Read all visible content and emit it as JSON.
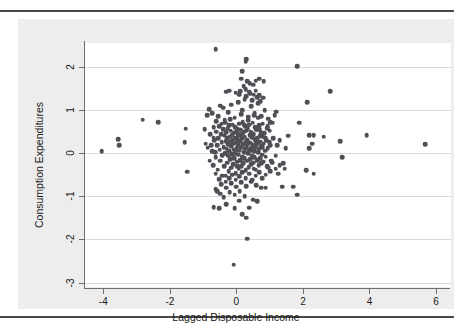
{
  "chart_data": {
    "type": "scatter",
    "title": "",
    "xlabel": "Lagged Disposable Income",
    "ylabel": "Consumption Expenditures",
    "xlim": [
      -4.55,
      6.45
    ],
    "ylim": [
      -3.1,
      2.55
    ],
    "xticks": [
      -4,
      -2,
      0,
      2,
      4,
      6
    ],
    "xtick_labels": [
      "-4",
      "-2",
      "0",
      "2",
      "4",
      "6"
    ],
    "yticks": [
      2,
      1,
      0,
      -1,
      -2,
      -3
    ],
    "ytick_labels": [
      "2",
      "1",
      "0",
      "-1",
      "-2",
      "-3"
    ],
    "grid": "horizontal",
    "legend": "none",
    "marker_color": "#4f5055",
    "marker_size": 4.6,
    "plot_background": "#ffffff",
    "graph_background": "#ededed",
    "gridline_color": "#d9d9d9",
    "axis_color": "#6e6e6e",
    "n_points": 352,
    "points": [
      [
        -4.05,
        0.05
      ],
      [
        -3.55,
        0.32
      ],
      [
        -3.52,
        0.18
      ],
      [
        -2.82,
        0.77
      ],
      [
        -2.35,
        0.72
      ],
      [
        -1.52,
        0.57
      ],
      [
        -1.55,
        0.25
      ],
      [
        -1.48,
        -0.43
      ],
      [
        -0.95,
        0.55
      ],
      [
        -0.82,
        1.02
      ],
      [
        -0.92,
        0.22
      ],
      [
        -0.86,
        0.13
      ],
      [
        -0.78,
        0.44
      ],
      [
        -0.72,
        0.05
      ],
      [
        -0.7,
        -0.28
      ],
      [
        -0.68,
        0.6
      ],
      [
        -0.66,
        0.3
      ],
      [
        -0.64,
        0.02
      ],
      [
        -0.62,
        -0.1
      ],
      [
        -0.6,
        0.5
      ],
      [
        -0.58,
        0.18
      ],
      [
        -0.56,
        -0.38
      ],
      [
        -0.54,
        0.35
      ],
      [
        -0.52,
        0.62
      ],
      [
        -0.5,
        0.08
      ],
      [
        -0.48,
        -0.18
      ],
      [
        -0.46,
        0.44
      ],
      [
        -0.44,
        0.25
      ],
      [
        -0.42,
        -0.05
      ],
      [
        -0.4,
        0.55
      ],
      [
        -0.38,
        0.14
      ],
      [
        -0.36,
        -0.3
      ],
      [
        -0.35,
        0.4
      ],
      [
        -0.34,
        0.7
      ],
      [
        -0.33,
        0.0
      ],
      [
        -0.32,
        -0.52
      ],
      [
        -0.31,
        0.28
      ],
      [
        -0.3,
        0.48
      ],
      [
        -0.29,
        0.1
      ],
      [
        -0.28,
        -0.22
      ],
      [
        -0.27,
        0.34
      ],
      [
        -0.26,
        0.58
      ],
      [
        -0.25,
        -0.06
      ],
      [
        -0.24,
        0.2
      ],
      [
        -0.23,
        -0.42
      ],
      [
        -0.22,
        0.64
      ],
      [
        -0.21,
        0.04
      ],
      [
        -0.2,
        0.38
      ],
      [
        -0.19,
        -0.14
      ],
      [
        -0.18,
        0.26
      ],
      [
        -0.17,
        0.52
      ],
      [
        -0.16,
        -0.34
      ],
      [
        -0.15,
        0.16
      ],
      [
        -0.14,
        0.42
      ],
      [
        -0.13,
        -0.02
      ],
      [
        -0.12,
        0.3
      ],
      [
        -0.11,
        0.66
      ],
      [
        -0.1,
        -0.26
      ],
      [
        -0.09,
        0.22
      ],
      [
        -0.08,
        0.46
      ],
      [
        -0.07,
        0.08
      ],
      [
        -0.06,
        -0.12
      ],
      [
        -0.05,
        0.36
      ],
      [
        -0.04,
        0.6
      ],
      [
        -0.03,
        0.0
      ],
      [
        -0.02,
        -0.46
      ],
      [
        -0.01,
        0.24
      ],
      [
        0.0,
        0.5
      ],
      [
        0.01,
        0.12
      ],
      [
        0.02,
        -0.2
      ],
      [
        0.03,
        0.32
      ],
      [
        0.04,
        0.56
      ],
      [
        0.05,
        -0.04
      ],
      [
        0.06,
        0.18
      ],
      [
        0.07,
        -0.36
      ],
      [
        0.08,
        0.68
      ],
      [
        0.09,
        0.06
      ],
      [
        0.1,
        0.4
      ],
      [
        0.11,
        -0.16
      ],
      [
        0.12,
        0.28
      ],
      [
        0.13,
        0.54
      ],
      [
        0.14,
        -0.3
      ],
      [
        0.15,
        0.14
      ],
      [
        0.16,
        0.44
      ],
      [
        0.17,
        -0.08
      ],
      [
        0.18,
        0.34
      ],
      [
        0.19,
        0.72
      ],
      [
        0.2,
        -0.24
      ],
      [
        0.21,
        0.2
      ],
      [
        0.22,
        0.48
      ],
      [
        0.23,
        0.02
      ],
      [
        0.24,
        -0.12
      ],
      [
        0.25,
        0.38
      ],
      [
        0.26,
        0.62
      ],
      [
        0.27,
        0.1
      ],
      [
        0.28,
        -0.4
      ],
      [
        0.29,
        0.26
      ],
      [
        0.3,
        0.52
      ],
      [
        0.31,
        0.16
      ],
      [
        0.32,
        -0.18
      ],
      [
        0.33,
        0.3
      ],
      [
        0.34,
        0.58
      ],
      [
        0.35,
        0.0
      ],
      [
        0.36,
        0.22
      ],
      [
        0.37,
        -0.32
      ],
      [
        0.38,
        0.66
      ],
      [
        0.39,
        0.08
      ],
      [
        0.4,
        0.42
      ],
      [
        0.41,
        -0.14
      ],
      [
        0.42,
        0.24
      ],
      [
        0.43,
        0.5
      ],
      [
        0.44,
        -0.26
      ],
      [
        0.45,
        0.12
      ],
      [
        0.46,
        0.46
      ],
      [
        0.47,
        -0.06
      ],
      [
        0.48,
        0.36
      ],
      [
        0.49,
        0.7
      ],
      [
        0.5,
        -0.22
      ],
      [
        0.51,
        0.18
      ],
      [
        0.52,
        0.44
      ],
      [
        0.53,
        0.04
      ],
      [
        0.54,
        -0.1
      ],
      [
        0.55,
        0.32
      ],
      [
        0.56,
        0.6
      ],
      [
        0.57,
        0.14
      ],
      [
        0.58,
        -0.38
      ],
      [
        0.59,
        0.28
      ],
      [
        0.6,
        0.54
      ],
      [
        0.61,
        0.2
      ],
      [
        0.62,
        -0.16
      ],
      [
        0.63,
        0.34
      ],
      [
        0.64,
        0.56
      ],
      [
        0.65,
        0.02
      ],
      [
        0.66,
        0.24
      ],
      [
        0.67,
        -0.28
      ],
      [
        0.68,
        0.64
      ],
      [
        0.69,
        0.1
      ],
      [
        0.7,
        0.4
      ],
      [
        0.71,
        -0.12
      ],
      [
        0.72,
        0.26
      ],
      [
        0.73,
        0.48
      ],
      [
        0.74,
        -0.24
      ],
      [
        0.75,
        0.16
      ],
      [
        0.76,
        0.44
      ],
      [
        0.77,
        -0.04
      ],
      [
        0.78,
        0.38
      ],
      [
        0.79,
        0.68
      ],
      [
        0.8,
        -0.2
      ],
      [
        0.82,
        0.22
      ],
      [
        0.84,
        0.46
      ],
      [
        0.86,
        0.06
      ],
      [
        0.88,
        -0.08
      ],
      [
        0.9,
        0.3
      ],
      [
        0.92,
        0.58
      ],
      [
        0.94,
        0.12
      ],
      [
        0.96,
        -0.34
      ],
      [
        0.98,
        0.26
      ],
      [
        1.0,
        0.52
      ],
      [
        1.02,
        0.18
      ],
      [
        1.05,
        -0.18
      ],
      [
        -0.88,
        0.88
      ],
      [
        -0.72,
        0.92
      ],
      [
        -0.55,
        0.85
      ],
      [
        -0.4,
        1.05
      ],
      [
        -0.25,
        0.95
      ],
      [
        -0.15,
        1.12
      ],
      [
        -0.05,
        0.82
      ],
      [
        0.05,
        1.18
      ],
      [
        0.15,
        0.9
      ],
      [
        0.25,
        1.25
      ],
      [
        0.35,
        0.84
      ],
      [
        0.45,
        1.08
      ],
      [
        0.55,
        0.94
      ],
      [
        0.65,
        1.15
      ],
      [
        0.75,
        0.86
      ],
      [
        0.85,
        1.0
      ],
      [
        0.95,
        0.8
      ],
      [
        0.62,
        1.3
      ],
      [
        0.48,
        1.22
      ],
      [
        0.3,
        1.32
      ],
      [
        0.18,
        1.0
      ],
      [
        0.08,
        1.35
      ],
      [
        -0.18,
        0.78
      ],
      [
        -0.35,
        0.76
      ],
      [
        -0.48,
        1.1
      ],
      [
        0.38,
        1.42
      ],
      [
        0.52,
        1.35
      ],
      [
        0.68,
        1.34
      ],
      [
        0.8,
        1.28
      ],
      [
        0.72,
        1.2
      ],
      [
        0.58,
        1.45
      ],
      [
        0.42,
        1.38
      ],
      [
        0.28,
        1.48
      ],
      [
        0.12,
        1.44
      ],
      [
        -0.02,
        1.4
      ],
      [
        -0.22,
        1.45
      ],
      [
        -0.3,
        1.42
      ],
      [
        0.22,
        1.55
      ],
      [
        0.4,
        1.62
      ],
      [
        0.58,
        1.68
      ],
      [
        0.68,
        1.72
      ],
      [
        0.82,
        1.66
      ],
      [
        0.5,
        1.58
      ],
      [
        0.32,
        1.66
      ],
      [
        0.18,
        1.9
      ],
      [
        0.28,
        2.12
      ],
      [
        0.3,
        2.18
      ],
      [
        0.14,
        1.72
      ],
      [
        -0.62,
        2.4
      ],
      [
        1.82,
        2.01
      ],
      [
        2.82,
        1.43
      ],
      [
        2.12,
        1.18
      ],
      [
        1.88,
        0.7
      ],
      [
        2.18,
        0.42
      ],
      [
        2.32,
        0.42
      ],
      [
        2.28,
        0.22
      ],
      [
        2.18,
        0.12
      ],
      [
        2.62,
        0.38
      ],
      [
        3.12,
        0.28
      ],
      [
        3.92,
        0.42
      ],
      [
        5.68,
        0.2
      ],
      [
        3.18,
        -0.1
      ],
      [
        2.1,
        -0.4
      ],
      [
        2.32,
        -0.48
      ],
      [
        1.82,
        -0.96
      ],
      [
        1.7,
        -0.78
      ],
      [
        1.4,
        -0.24
      ],
      [
        1.22,
        0.18
      ],
      [
        1.18,
        -0.06
      ],
      [
        1.3,
        0.3
      ],
      [
        1.48,
        0.12
      ],
      [
        1.55,
        0.4
      ],
      [
        1.1,
        0.34
      ],
      [
        1.08,
        0.7
      ],
      [
        1.15,
        0.88
      ],
      [
        1.2,
        0.96
      ],
      [
        1.02,
        0.72
      ],
      [
        0.92,
        -0.3
      ],
      [
        1.08,
        -0.22
      ],
      [
        1.18,
        -0.36
      ],
      [
        1.3,
        -0.28
      ],
      [
        1.02,
        -0.42
      ],
      [
        0.88,
        -0.5
      ],
      [
        0.78,
        -0.58
      ],
      [
        0.68,
        -0.44
      ],
      [
        0.58,
        -0.52
      ],
      [
        0.48,
        -0.62
      ],
      [
        0.38,
        -0.48
      ],
      [
        0.28,
        -0.58
      ],
      [
        0.18,
        -0.44
      ],
      [
        0.08,
        -0.54
      ],
      [
        -0.02,
        -0.62
      ],
      [
        -0.12,
        -0.5
      ],
      [
        -0.22,
        -0.58
      ],
      [
        -0.32,
        -0.66
      ],
      [
        -0.42,
        -0.52
      ],
      [
        -0.52,
        -0.6
      ],
      [
        -0.62,
        -0.48
      ],
      [
        -0.45,
        -0.72
      ],
      [
        -0.3,
        -0.8
      ],
      [
        -0.15,
        -0.7
      ],
      [
        0.0,
        -0.78
      ],
      [
        0.15,
        -0.68
      ],
      [
        0.3,
        -0.76
      ],
      [
        0.45,
        -0.66
      ],
      [
        0.6,
        -0.74
      ],
      [
        0.75,
        -0.8
      ],
      [
        0.88,
        -0.8
      ],
      [
        -0.58,
        -0.88
      ],
      [
        -0.48,
        -0.94
      ],
      [
        -0.38,
        -1.02
      ],
      [
        -0.2,
        -0.9
      ],
      [
        -0.05,
        -0.96
      ],
      [
        0.1,
        -0.88
      ],
      [
        0.25,
        -1.0
      ],
      [
        -0.68,
        -1.25
      ],
      [
        -0.52,
        -1.28
      ],
      [
        -0.05,
        -1.28
      ],
      [
        0.38,
        -1.26
      ],
      [
        0.18,
        -1.42
      ],
      [
        0.3,
        -1.5
      ],
      [
        0.32,
        -1.98
      ],
      [
        -0.08,
        -2.58
      ],
      [
        -0.62,
        -0.84
      ],
      [
        -0.3,
        -1.18
      ],
      [
        0.08,
        -1.1
      ],
      [
        0.5,
        -1.08
      ],
      [
        -0.68,
        0.36
      ],
      [
        -0.75,
        0.18
      ],
      [
        -0.8,
        -0.18
      ],
      [
        -0.6,
        0.74
      ],
      [
        -0.44,
        0.68
      ],
      [
        1.38,
        -0.78
      ],
      [
        1.25,
        -0.48
      ],
      [
        1.45,
        -0.36
      ],
      [
        0.62,
        -1.12
      ],
      [
        0.02,
        -0.3
      ],
      [
        0.06,
        0.44
      ],
      [
        0.44,
        0.06
      ],
      [
        0.52,
        -0.36
      ],
      [
        0.36,
        0.76
      ],
      [
        0.24,
        0.66
      ],
      [
        0.12,
        0.54
      ],
      [
        0.0,
        0.34
      ],
      [
        0.7,
        0.56
      ],
      [
        0.78,
        0.14
      ],
      [
        0.86,
        0.36
      ],
      [
        0.94,
        0.62
      ],
      [
        0.66,
        0.82
      ],
      [
        0.54,
        0.88
      ]
    ]
  },
  "axis_titles": {
    "x": "Lagged Disposable Income",
    "y": "Consumption Expenditures"
  }
}
